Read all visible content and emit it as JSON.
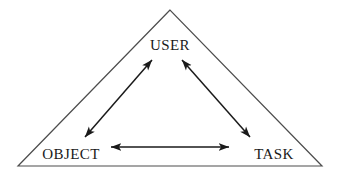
{
  "diagram": {
    "shape": "triangle",
    "background_color": "#ffffff",
    "outline_color": "#4d4d4d",
    "arrow_color": "#1a1a1a",
    "text_color": "#1a1a1a",
    "nodes": [
      {
        "id": "user",
        "label": "USER",
        "position": "apex",
        "x": 170,
        "y": 45
      },
      {
        "id": "object",
        "label": "OBJECT",
        "position": "bottom-left",
        "x": 71,
        "y": 154
      },
      {
        "id": "task",
        "label": "TASK",
        "position": "bottom-right",
        "x": 274,
        "y": 154
      }
    ],
    "triangle_vertices": [
      {
        "x": 170,
        "y": 10
      },
      {
        "x": 18,
        "y": 166
      },
      {
        "x": 322,
        "y": 166
      }
    ],
    "connectors": [
      {
        "id": "object-user",
        "from": "OBJECT",
        "to": "USER",
        "style": "double-headed-arrow",
        "from_point": {
          "x": 85,
          "y": 137
        },
        "to_point": {
          "x": 152,
          "y": 60
        }
      },
      {
        "id": "user-task",
        "from": "USER",
        "to": "TASK",
        "style": "double-headed-arrow",
        "from_point": {
          "x": 182,
          "y": 60
        },
        "to_point": {
          "x": 250,
          "y": 137
        }
      },
      {
        "id": "object-task",
        "from": "OBJECT",
        "to": "TASK",
        "style": "double-headed-arrow",
        "from_point": {
          "x": 111,
          "y": 147
        },
        "to_point": {
          "x": 229,
          "y": 147
        }
      }
    ]
  }
}
